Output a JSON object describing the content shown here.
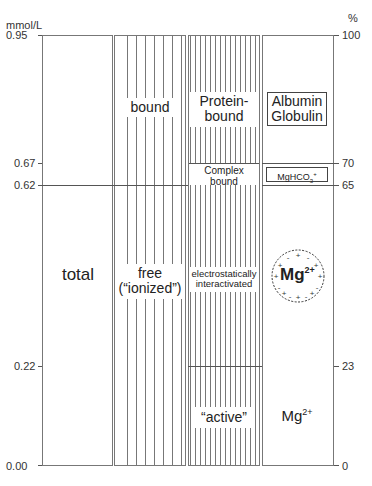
{
  "left_axis": {
    "unit": "mmol/L",
    "ticks": [
      "0.95",
      "0.67",
      "0.62",
      "0.22",
      "0.00"
    ]
  },
  "right_axis": {
    "unit": "%",
    "ticks": [
      "100",
      "70",
      "65",
      "23",
      "0"
    ]
  },
  "columns": {
    "total": {
      "label": "total"
    },
    "col2": {
      "bound": "bound",
      "free_1": "free",
      "free_2": "(“ionized”)"
    },
    "col3": {
      "protein_1": "Protein-",
      "protein_2": "bound",
      "complex_1": "Complex",
      "complex_2": "bound",
      "electro_1": "electrostatically",
      "electro_2": "interactivated",
      "active": "“active”"
    },
    "col4": {
      "albumin": "Albumin",
      "globulin": "Globulin",
      "mghco3": "MgHCO",
      "mghco3_sub": "3",
      "mghco3_sup": "+",
      "mg_circle": "Mg",
      "mg_circle_sup": "2+",
      "mg_free": "Mg",
      "mg_free_sup": "2+"
    }
  }
}
